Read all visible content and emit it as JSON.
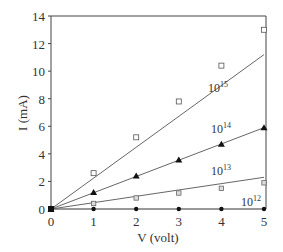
{
  "chart_data": {
    "type": "scatter",
    "title": "",
    "xlabel": "V (volt)",
    "ylabel": "I (mA)",
    "xlim": [
      0,
      5
    ],
    "ylim": [
      0,
      14
    ],
    "x_ticks": [
      "0",
      "1",
      "2",
      "3",
      "4",
      "5"
    ],
    "y_ticks": [
      "0",
      "2",
      "4",
      "6",
      "8",
      "10",
      "12",
      "14"
    ],
    "grid": false,
    "legend": "inline labels",
    "x": [
      0,
      1,
      2,
      3,
      4,
      5
    ],
    "series": [
      {
        "name": "10^15",
        "label_base": "10",
        "label_exp": "15",
        "marker": "open-square",
        "values": [
          0,
          2.6,
          5.2,
          7.8,
          10.4,
          13.0
        ],
        "fit_line_end": 11.2
      },
      {
        "name": "10^14",
        "label_base": "10",
        "label_exp": "14",
        "marker": "filled-triangle",
        "values": [
          0,
          1.2,
          2.4,
          3.55,
          4.7,
          5.9
        ],
        "fit_line_end": 5.9
      },
      {
        "name": "10^13",
        "label_base": "10",
        "label_exp": "13",
        "marker": "hatched-square",
        "values": [
          0,
          0.4,
          0.8,
          1.16,
          1.5,
          1.9
        ],
        "fit_line_end": 2.3
      },
      {
        "name": "10^12",
        "label_base": "10",
        "label_exp": "12",
        "marker": "filled-circle",
        "values": [
          0,
          0,
          0,
          0,
          0,
          0
        ],
        "fit_line_end": 0
      }
    ]
  }
}
